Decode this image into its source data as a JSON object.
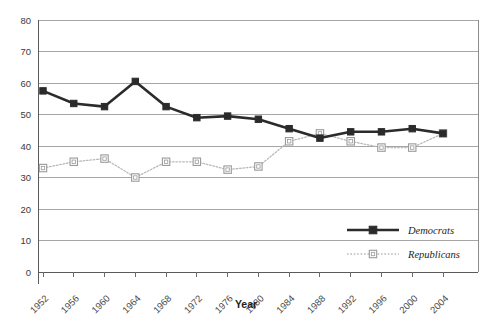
{
  "chart_data": {
    "type": "line",
    "title": "",
    "subtitle": "",
    "xlabel": "Year",
    "ylabel": "",
    "grid": true,
    "legend_position": "inside-right-lower",
    "xlim": [
      1950,
      2006
    ],
    "ylim": [
      0,
      80
    ],
    "yticks": [
      0,
      10,
      20,
      30,
      40,
      50,
      60,
      70,
      80
    ],
    "categories": [
      "1952",
      "1956",
      "1960",
      "1964",
      "1968",
      "1972",
      "1976",
      "1980",
      "1984",
      "1988",
      "1992",
      "1996",
      "2000",
      "2004"
    ],
    "x": [
      1952,
      1956,
      1960,
      1964,
      1968,
      1972,
      1976,
      1980,
      1984,
      1988,
      1992,
      1996,
      2000,
      2004
    ],
    "series": [
      {
        "name": "Democrats",
        "color": "#2b2b2b",
        "marker": "square-filled",
        "linestyle": "solid",
        "values": [
          57.5,
          53.5,
          52.5,
          60.5,
          52.5,
          49,
          49.5,
          48.5,
          45.5,
          42.5,
          44.5,
          44.5,
          45.5,
          44
        ]
      },
      {
        "name": "Republicans",
        "color": "#b9b9b9",
        "marker": "square-open",
        "linestyle": "dotted",
        "values": [
          33,
          35,
          36,
          30,
          35,
          35,
          32.5,
          33.5,
          41.5,
          44,
          41.5,
          39.5,
          39.5,
          44
        ]
      }
    ]
  },
  "legend": {
    "items": [
      {
        "label": "Democrats"
      },
      {
        "label": "Republicans"
      }
    ]
  },
  "axes": {
    "x_title": "Year",
    "y_ticks": [
      "80",
      "70",
      "60",
      "50",
      "40",
      "30",
      "20",
      "10",
      "0"
    ],
    "x_ticks": [
      "1952",
      "1956",
      "1960",
      "1964",
      "1968",
      "1972",
      "1976",
      "1980",
      "1984",
      "1988",
      "1992",
      "1996",
      "2000",
      "2004"
    ]
  },
  "colors": {
    "democrats": "#2b2b2b",
    "republicans": "#b9b9b9",
    "gridline": "#a6a6a6",
    "background": "#ffffff"
  }
}
